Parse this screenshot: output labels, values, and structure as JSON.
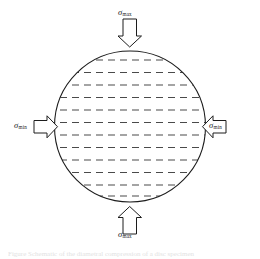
{
  "figure": {
    "background_color": "#ffffff",
    "width": 260,
    "height": 259,
    "caption": "Figure  Schematic of the diametral compression of a disc specimen",
    "geometry": {
      "circle": {
        "cx": 130,
        "cy": 126.5,
        "r": 75.5
      },
      "stroke_color": "#1c1c1c",
      "hatch_color": "#4a4a4a",
      "hatch_line_count": 12,
      "hatch_dash_pattern": "7 5"
    },
    "labels": {
      "top": {
        "symbol": "σ",
        "subscript": "max"
      },
      "bottom": {
        "symbol": "σ",
        "subscript": "max"
      },
      "left": {
        "symbol": "σ",
        "subscript": "min"
      },
      "right": {
        "symbol": "σ",
        "subscript": "min"
      }
    },
    "arrows": {
      "top": {
        "direction": "down",
        "style": "hollow-block"
      },
      "bottom": {
        "direction": "up",
        "style": "hollow-block"
      },
      "left": {
        "direction": "right",
        "style": "hollow-block"
      },
      "right": {
        "direction": "left",
        "style": "hollow-block"
      }
    }
  }
}
